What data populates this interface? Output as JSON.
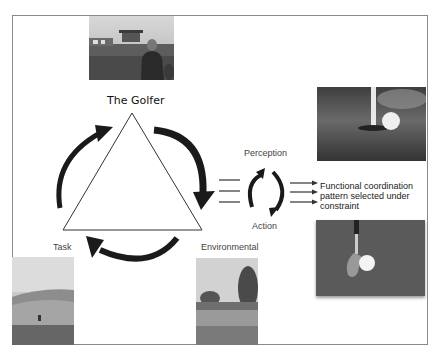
{
  "diagram": {
    "title": "The Golfer",
    "constraints": {
      "task": "Task",
      "environmental": "Environmental",
      "organismic": "The Golfer"
    },
    "cycle": {
      "top": "Perception",
      "bottom": "Action"
    },
    "outcome": {
      "lines": [
        "Functional coordination",
        "pattern selected under",
        "constraint"
      ]
    },
    "photos": {
      "golfer": "golfer-portrait-photo",
      "task": "golf-course-hill-photo",
      "environmental": "golf-course-trees-photo",
      "hole": "golf-ball-in-hole-photo",
      "club": "club-and-ball-photo"
    }
  }
}
